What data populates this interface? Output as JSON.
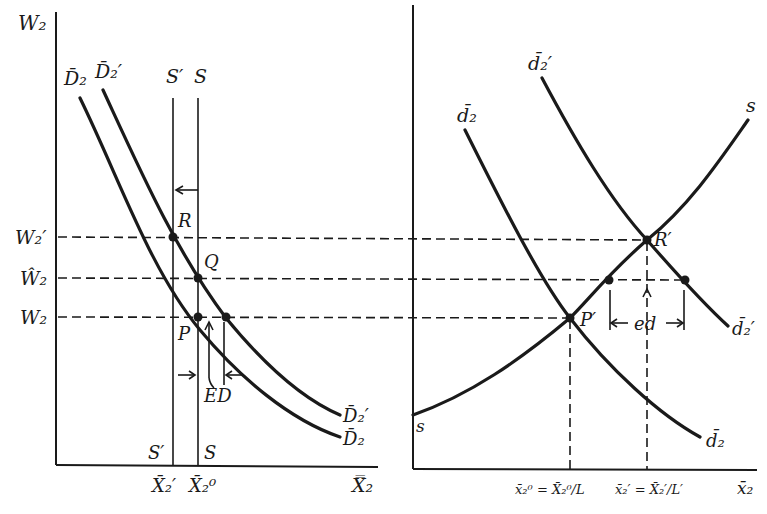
{
  "figure": {
    "left_panel": {
      "y_axis_label": "W₂",
      "x_axis_label": "X̿₂",
      "y_ticks": [
        "W₂′",
        "Ŵ₂",
        "W₂"
      ],
      "x_ticks": [
        "X̄₂′",
        "X̄₂⁰"
      ],
      "curves": {
        "demand": "D̄₂",
        "demand_shifted": "D̄₂′",
        "supply": "S",
        "supply_shifted": "S′"
      },
      "curve_end_labels": {
        "demand_shifted": "D̄₂′",
        "demand": "D̄₂",
        "supply_shifted_bottom": "S′",
        "supply_bottom": "S"
      },
      "points": [
        "R",
        "Q",
        "P"
      ],
      "annotation": "ED"
    },
    "right_panel": {
      "x_axis_label": "x̄₂",
      "x_ticks": [
        "x̄₂⁰ = X̄₂⁰/L",
        "x̄₂′ = X̄₂′/L′"
      ],
      "curves": {
        "demand": "d̄₂",
        "demand_shifted": "d̄₂′",
        "supply": "s"
      },
      "curve_end_labels": {
        "demand_shifted": "d̄₂′",
        "demand": "d̄₂",
        "supply": "s"
      },
      "points": [
        "R′",
        "P′"
      ],
      "annotation": "ed"
    }
  }
}
